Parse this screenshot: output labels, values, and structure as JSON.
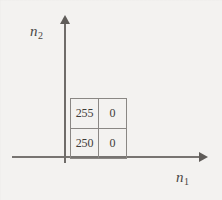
{
  "figure": {
    "width": 222,
    "height": 200,
    "background_color": "#f3f2f0",
    "line_color": "#777471",
    "text_color": "#3f3c39"
  },
  "axes": {
    "x": {
      "label_base": "n",
      "label_sub": "1",
      "arrow": "arrow-right",
      "direction": "horizontal"
    },
    "y": {
      "label_base": "n",
      "label_sub": "2",
      "arrow": "arrow-up",
      "direction": "vertical"
    }
  },
  "chart_data": {
    "type": "heatmap",
    "title": "",
    "subtitle": "",
    "xlabel": "n1",
    "ylabel": "n2",
    "grid": true,
    "legend": "none",
    "rows": 2,
    "cols": 2,
    "x": [
      0,
      1
    ],
    "y": [
      0,
      1
    ],
    "values": [
      [
        "255",
        "0"
      ],
      [
        "250",
        "0"
      ]
    ],
    "cells": [
      {
        "row": 0,
        "col": 0,
        "n1": 0,
        "n2": 1,
        "value": "255"
      },
      {
        "row": 0,
        "col": 1,
        "n1": 1,
        "n2": 1,
        "value": "0"
      },
      {
        "row": 1,
        "col": 0,
        "n1": 0,
        "n2": 0,
        "value": "250"
      },
      {
        "row": 1,
        "col": 1,
        "n1": 1,
        "n2": 0,
        "value": "0"
      }
    ]
  }
}
